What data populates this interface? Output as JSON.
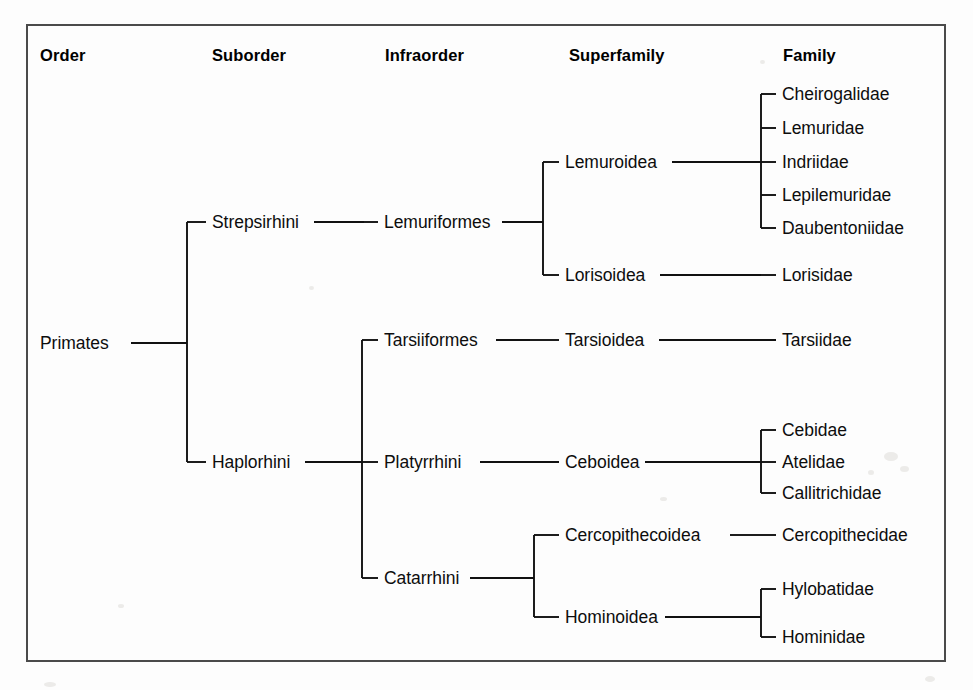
{
  "figure": {
    "background_color": "#fdfdfd",
    "border_color": "#4a4a4a",
    "line_color": "#111111"
  },
  "columns": [
    {
      "key": "order",
      "label": "Order",
      "x": 40,
      "y": 46
    },
    {
      "key": "suborder",
      "label": "Suborder",
      "x": 212,
      "y": 46
    },
    {
      "key": "infraorder",
      "label": "Infraorder",
      "x": 385,
      "y": 46
    },
    {
      "key": "superfamily",
      "label": "Superfamily",
      "x": 569,
      "y": 46
    },
    {
      "key": "family",
      "label": "Family",
      "x": 783,
      "y": 46
    }
  ],
  "nodes": [
    {
      "id": "primates",
      "label": "Primates",
      "rank": "order",
      "x": 40,
      "y": 343
    },
    {
      "id": "strepsirhini",
      "label": "Strepsirhini",
      "rank": "suborder",
      "x": 212,
      "y": 222
    },
    {
      "id": "haplorhini",
      "label": "Haplorhini",
      "rank": "suborder",
      "x": 212,
      "y": 462
    },
    {
      "id": "lemuriformes",
      "label": "Lemuriformes",
      "rank": "infraorder",
      "x": 384,
      "y": 222
    },
    {
      "id": "tarsiiformes",
      "label": "Tarsiiformes",
      "rank": "infraorder",
      "x": 384,
      "y": 340
    },
    {
      "id": "platyrrhini",
      "label": "Platyrrhini",
      "rank": "infraorder",
      "x": 384,
      "y": 462
    },
    {
      "id": "catarrhini",
      "label": "Catarrhini",
      "rank": "infraorder",
      "x": 384,
      "y": 578
    },
    {
      "id": "lemuroidea",
      "label": "Lemuroidea",
      "rank": "superfamily",
      "x": 565,
      "y": 162
    },
    {
      "id": "lorisoidea",
      "label": "Lorisoidea",
      "rank": "superfamily",
      "x": 565,
      "y": 275
    },
    {
      "id": "tarsioidea",
      "label": "Tarsioidea",
      "rank": "superfamily",
      "x": 565,
      "y": 340
    },
    {
      "id": "ceboidea",
      "label": "Ceboidea",
      "rank": "superfamily",
      "x": 565,
      "y": 462
    },
    {
      "id": "cercopithecoidea",
      "label": "Cercopithecoidea",
      "rank": "superfamily",
      "x": 565,
      "y": 535
    },
    {
      "id": "hominoidea",
      "label": "Hominoidea",
      "rank": "superfamily",
      "x": 565,
      "y": 617
    },
    {
      "id": "cheirogalidae",
      "label": "Cheirogalidae",
      "rank": "family",
      "x": 782,
      "y": 94
    },
    {
      "id": "lemuridae",
      "label": "Lemuridae",
      "rank": "family",
      "x": 782,
      "y": 128
    },
    {
      "id": "indriidae",
      "label": "Indriidae",
      "rank": "family",
      "x": 782,
      "y": 162
    },
    {
      "id": "lepilemuridae",
      "label": "Lepilemuridae",
      "rank": "family",
      "x": 782,
      "y": 195
    },
    {
      "id": "daubentoniidae",
      "label": "Daubentoniidae",
      "rank": "family",
      "x": 782,
      "y": 228
    },
    {
      "id": "lorisidae",
      "label": "Lorisidae",
      "rank": "family",
      "x": 782,
      "y": 275
    },
    {
      "id": "tarsiidae",
      "label": "Tarsiidae",
      "rank": "family",
      "x": 782,
      "y": 340
    },
    {
      "id": "cebidae",
      "label": "Cebidae",
      "rank": "family",
      "x": 782,
      "y": 430
    },
    {
      "id": "atelidae",
      "label": "Atelidae",
      "rank": "family",
      "x": 782,
      "y": 462
    },
    {
      "id": "callitrichidae",
      "label": "Callitrichidae",
      "rank": "family",
      "x": 782,
      "y": 493
    },
    {
      "id": "cercopithecidae",
      "label": "Cercopithecidae",
      "rank": "family",
      "x": 782,
      "y": 535
    },
    {
      "id": "hylobatidae",
      "label": "Hylobatidae",
      "rank": "family",
      "x": 782,
      "y": 589
    },
    {
      "id": "hominidae",
      "label": "Hominidae",
      "rank": "family",
      "x": 782,
      "y": 637
    }
  ],
  "edges": [
    {
      "from": "primates",
      "to": [
        "strepsirhini",
        "haplorhini"
      ],
      "stem_x": 131,
      "spine_x": 187,
      "tip_x": 206,
      "parent_y": 343
    },
    {
      "from": "strepsirhini",
      "to": [
        "lemuriformes"
      ],
      "stem_x": 314,
      "spine_x": 364,
      "tip_x": 378,
      "parent_y": 222
    },
    {
      "from": "lemuriformes",
      "to": [
        "lemuroidea",
        "lorisoidea"
      ],
      "stem_x": 502,
      "spine_x": 543,
      "tip_x": 559,
      "parent_y": 222
    },
    {
      "from": "lemuroidea",
      "to": [
        "cheirogalidae",
        "lemuridae",
        "indriidae",
        "lepilemuridae",
        "daubentoniidae"
      ],
      "stem_x": 672,
      "spine_x": 761,
      "tip_x": 776,
      "parent_y": 162
    },
    {
      "from": "lorisoidea",
      "to": [
        "lorisidae"
      ],
      "stem_x": 660,
      "spine_x": 761,
      "tip_x": 776,
      "parent_y": 275
    },
    {
      "from": "haplorhini",
      "to": [
        "tarsiiformes",
        "platyrrhini",
        "catarrhini"
      ],
      "stem_x": 305,
      "spine_x": 362,
      "tip_x": 378,
      "parent_y": 462
    },
    {
      "from": "tarsiiformes",
      "to": [
        "tarsioidea"
      ],
      "stem_x": 496,
      "spine_x": 530,
      "tip_x": 559,
      "parent_y": 340
    },
    {
      "from": "tarsioidea",
      "to": [
        "tarsiidae"
      ],
      "stem_x": 659,
      "spine_x": 700,
      "tip_x": 776,
      "parent_y": 340
    },
    {
      "from": "platyrrhini",
      "to": [
        "ceboidea"
      ],
      "stem_x": 480,
      "spine_x": 520,
      "tip_x": 559,
      "parent_y": 462
    },
    {
      "from": "ceboidea",
      "to": [
        "cebidae",
        "atelidae",
        "callitrichidae"
      ],
      "stem_x": 645,
      "spine_x": 761,
      "tip_x": 776,
      "parent_y": 462
    },
    {
      "from": "catarrhini",
      "to": [
        "cercopithecoidea",
        "hominoidea"
      ],
      "stem_x": 470,
      "spine_x": 534,
      "tip_x": 559,
      "parent_y": 578
    },
    {
      "from": "cercopithecoidea",
      "to": [
        "cercopithecidae"
      ],
      "stem_x": 730,
      "spine_x": 752,
      "tip_x": 776,
      "parent_y": 535
    },
    {
      "from": "hominoidea",
      "to": [
        "hylobatidae",
        "hominidae"
      ],
      "stem_x": 665,
      "spine_x": 761,
      "tip_x": 776,
      "parent_y": 617
    }
  ]
}
